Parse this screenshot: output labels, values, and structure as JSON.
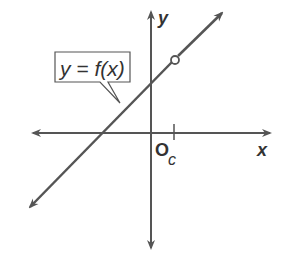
{
  "graph": {
    "x_axis_label": "x",
    "y_axis_label": "y",
    "origin_label": "O",
    "tick_label": "c",
    "function_label": "y = f(x)",
    "line_color": "#555555",
    "axis_color": "#555555",
    "open_circle": "discontinuity at x = c",
    "description": "Line with positive slope, open circle (hole) at x = c"
  }
}
